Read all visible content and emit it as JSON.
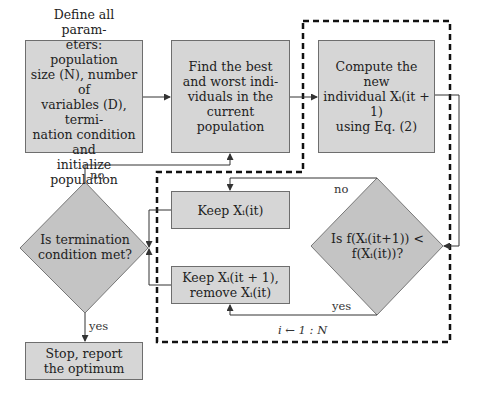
{
  "boxes": {
    "define": "Define all parameters: population size (N), number of variables (D), termination condition and initialize population",
    "define_lines": [
      "Define all param-",
      "eters: population",
      "size (N), number of",
      "variables (D), termi-",
      "nation condition and",
      "initialize population"
    ],
    "find": "Find the best and worst individuals in the current population",
    "find_lines": [
      "Find the best",
      "and worst indi-",
      "viduals in the",
      "current population"
    ],
    "compute": "Compute the new individual X_i(it+1) using Eq. (2)",
    "compute_lines": [
      "Compute the new",
      "individual Xᵢ(it + 1)",
      "using Eq. (2)"
    ],
    "keep_old": "Keep Xᵢ(it)",
    "keep_new_lines": [
      "Keep Xᵢ(it + 1),",
      "remove Xᵢ(it)"
    ],
    "stop_lines": [
      "Stop, report",
      "the optimum"
    ]
  },
  "decisions": {
    "termination_lines": [
      "Is termination",
      "condition met?"
    ],
    "compare_lines": [
      "Is f(Xᵢ(it+1)) <",
      "f(Xᵢ(it))?"
    ]
  },
  "labels": {
    "no_top": "no",
    "no_right": "no",
    "yes_bottom": "yes",
    "yes_right": "yes",
    "loop": "i ← 1 : N"
  },
  "colors": {
    "box_fill": "#d6d6d6",
    "box_border": "#6e6e6e",
    "line": "#333333",
    "dashed": "#111111"
  }
}
